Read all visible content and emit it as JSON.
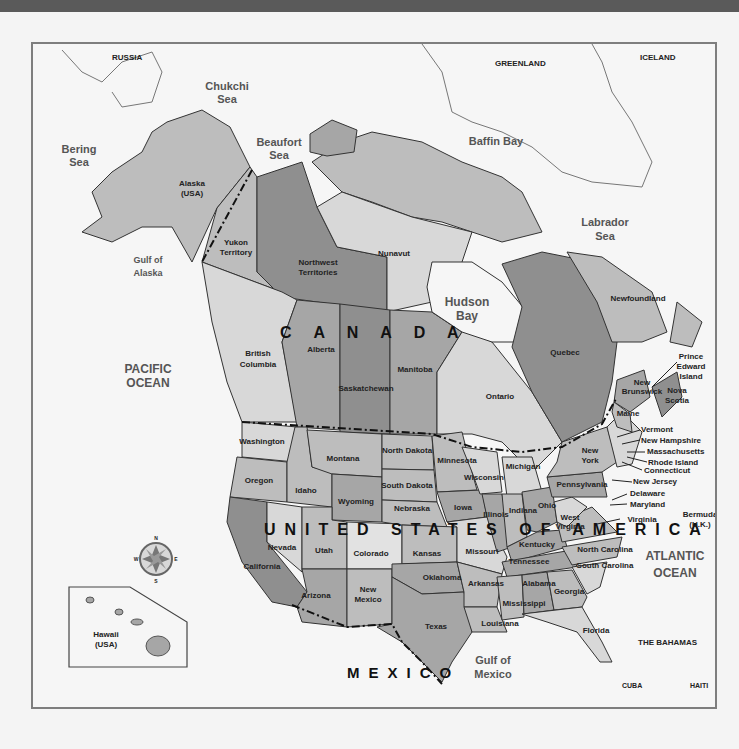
{
  "map": {
    "title": "North America",
    "countries": {
      "canada": "C A N A D A",
      "usa": "UNITED STATES OF AMERICA",
      "mexico": "MEXICO"
    },
    "water_bodies": [
      {
        "id": "chukchi",
        "line1": "Chukchi",
        "line2": "Sea"
      },
      {
        "id": "bering",
        "line1": "Bering",
        "line2": "Sea"
      },
      {
        "id": "beaufort",
        "line1": "Beaufort",
        "line2": "Sea"
      },
      {
        "id": "baffin",
        "line1": "Baffin Bay",
        "line2": ""
      },
      {
        "id": "labrador",
        "line1": "Labrador",
        "line2": "Sea"
      },
      {
        "id": "gulf_alaska",
        "line1": "Gulf of",
        "line2": "Alaska"
      },
      {
        "id": "hudson",
        "line1": "Hudson",
        "line2": "Bay"
      },
      {
        "id": "pacific",
        "line1": "PACIFIC",
        "line2": "OCEAN"
      },
      {
        "id": "atlantic",
        "line1": "ATLANTIC",
        "line2": "OCEAN"
      },
      {
        "id": "gulf_mexico",
        "line1": "Gulf of",
        "line2": "Mexico"
      }
    ],
    "other_places": {
      "russia": "RUSSIA",
      "greenland": "GREENLAND",
      "iceland": "ICELAND",
      "bermuda_1": "Bermuda",
      "bermuda_2": "(U.K.)",
      "bahamas": "THE BAHAMAS",
      "cuba": "CUBA",
      "haiti": "HAITI",
      "alaska_1": "Alaska",
      "alaska_2": "(USA)",
      "hawaii_1": "Hawaii",
      "hawaii_2": "(USA)"
    },
    "provinces": {
      "yukon_1": "Yukon",
      "yukon_2": "Territory",
      "nwt_1": "Northwest",
      "nwt_2": "Territories",
      "nunavut": "Nunavut",
      "bc_1": "British",
      "bc_2": "Columbia",
      "alberta": "Alberta",
      "saskatchewan": "Saskatchewan",
      "manitoba": "Manitoba",
      "ontario": "Ontario",
      "quebec": "Quebec",
      "newfoundland": "Newfoundland",
      "pei_1": "Prince",
      "pei_2": "Edward",
      "pei_3": "Island",
      "nb_1": "New",
      "nb_2": "Brunswick",
      "ns_1": "Nova",
      "ns_2": "Scotia"
    },
    "states": {
      "washington": "Washington",
      "oregon": "Oregon",
      "california": "California",
      "nevada": "Nevada",
      "idaho": "Idaho",
      "montana": "Montana",
      "wyoming": "Wyoming",
      "utah": "Utah",
      "colorado": "Colorado",
      "arizona": "Arizona",
      "new_mexico_1": "New",
      "new_mexico_2": "Mexico",
      "north_dakota": "North Dakota",
      "south_dakota": "South Dakota",
      "nebraska": "Nebraska",
      "kansas": "Kansas",
      "oklahoma": "Oklahoma",
      "texas": "Texas",
      "minnesota": "Minnesota",
      "iowa": "Iowa",
      "missouri": "Missouri",
      "arkansas": "Arkansas",
      "louisiana": "Louisiana",
      "wisconsin": "Wisconsin",
      "illinois": "Illinois",
      "michigan": "Michigan",
      "indiana": "Indiana",
      "ohio": "Ohio",
      "kentucky": "Kentucky",
      "tennessee": "Tennessee",
      "mississippi": "Mississippi",
      "alabama": "Alabama",
      "georgia": "Georgia",
      "florida": "Florida",
      "south_carolina": "South Carolina",
      "north_carolina": "North Carolina",
      "virginia": "Virginia",
      "west_virginia_1": "West",
      "west_virginia_2": "Virginia",
      "pennsylvania": "Pennsylvania",
      "new_york_1": "New",
      "new_york_2": "York",
      "maine": "Maine",
      "vermont": "Vermont",
      "new_hampshire": "New Hampshire",
      "massachusetts": "Massachusetts",
      "rhode_island": "Rhode Island",
      "connecticut": "Connecticut",
      "new_jersey": "New Jersey",
      "delaware": "Delaware",
      "maryland": "Maryland"
    },
    "compass": {
      "n": "N",
      "s": "S",
      "e": "E",
      "w": "W"
    },
    "colors": {
      "water": "#f6f6f6",
      "light": "#d8d8d8",
      "medium": "#bdbdbd",
      "mid_dark": "#a6a6a6",
      "dark": "#8f8f8f",
      "frame": "#7e7e7e",
      "topbar": "#5a5a5a"
    }
  }
}
